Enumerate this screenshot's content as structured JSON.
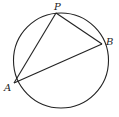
{
  "diagram": {
    "points": {
      "P": {
        "label": "P"
      },
      "B": {
        "label": "B"
      },
      "A": {
        "label": "A"
      }
    },
    "segments": [
      "AP",
      "PB",
      "AB"
    ],
    "colors": {
      "line": "#222222",
      "background": "#ffffff"
    }
  }
}
